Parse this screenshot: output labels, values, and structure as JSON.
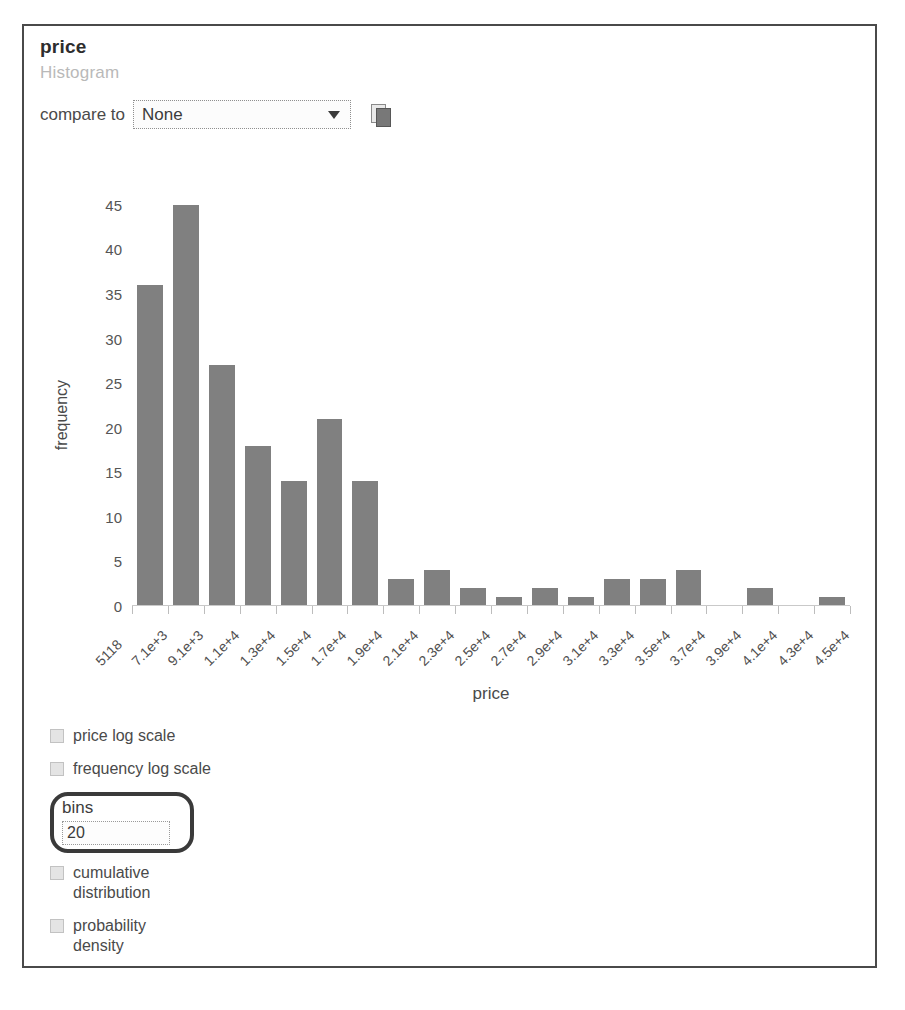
{
  "panel": {
    "title": "price",
    "subtitle": "Histogram"
  },
  "compare": {
    "label": "compare to",
    "selected": "None",
    "options": [
      "None"
    ],
    "chevron_icon": "chevron-down-icon",
    "copy_icon": "copy-icon"
  },
  "controls": {
    "price_log_scale": "price log scale",
    "frequency_log_scale": "frequency log scale",
    "bins_label": "bins",
    "bins_value": "20",
    "cumulative_distribution": "cumulative distribution",
    "probability_density": "probability density"
  },
  "colors": {
    "bar": "#808080",
    "card_border": "#4a4a4a",
    "highlight_ring": "#3a3a3a",
    "subtitle": "#b9b9b9"
  },
  "chart_data": {
    "type": "bar",
    "title": "price",
    "subtitle": "Histogram",
    "xlabel": "price",
    "ylabel": "frequency",
    "ylim": [
      0,
      46
    ],
    "yticks": [
      0,
      5,
      10,
      15,
      20,
      25,
      30,
      35,
      40,
      45
    ],
    "grid": false,
    "legend": null,
    "bins": 20,
    "bin_edges": [
      "5118",
      "7.1e+3",
      "9.1e+3",
      "1.1e+4",
      "1.3e+4",
      "1.5e+4",
      "1.7e+4",
      "1.9e+4",
      "2.1e+4",
      "2.3e+4",
      "2.5e+4",
      "2.7e+4",
      "2.9e+4",
      "3.1e+4",
      "3.3e+4",
      "3.5e+4",
      "3.7e+4",
      "3.9e+4",
      "4.1e+4",
      "4.3e+4",
      "4.5e+4"
    ],
    "categories": [
      "5118",
      "7.1e+3",
      "9.1e+3",
      "1.1e+4",
      "1.3e+4",
      "1.5e+4",
      "1.7e+4",
      "1.9e+4",
      "2.1e+4",
      "2.3e+4",
      "2.5e+4",
      "2.7e+4",
      "2.9e+4",
      "3.1e+4",
      "3.3e+4",
      "3.5e+4",
      "3.7e+4",
      "3.9e+4",
      "4.1e+4",
      "4.3e+4"
    ],
    "values": [
      36,
      45,
      27,
      18,
      14,
      21,
      14,
      3,
      4,
      2,
      1,
      2,
      1,
      3,
      3,
      4,
      0,
      2,
      0,
      1
    ]
  }
}
